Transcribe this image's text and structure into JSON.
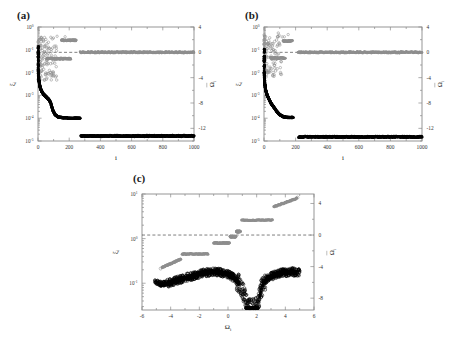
{
  "figure": {
    "panels": [
      {
        "label": "(a)",
        "xlabel": "i",
        "ylabel_left": "ξ",
        "ylabel_left_sub": "i",
        "ylabel_right": "Ω",
        "ylabel_right_sub": "i",
        "xticks": [
          "0",
          "200",
          "400",
          "600",
          "800",
          "1000"
        ],
        "xtick_values": [
          0,
          200,
          400,
          600,
          800,
          1000
        ],
        "xlim": [
          0,
          1000
        ],
        "yticks_left": [
          "10",
          "10",
          "10",
          "10",
          "10",
          "10"
        ],
        "yticks_left_exp": [
          "0",
          "-1",
          "-2",
          "-3",
          "-4",
          "-5"
        ],
        "ylim_left_log": [
          -5,
          0
        ],
        "yticks_right": [
          "4",
          "0",
          "-4",
          "-8",
          "-12"
        ],
        "ytick_right_values": [
          4,
          0,
          -4,
          -8,
          -12
        ],
        "ylim_right": [
          -14,
          4
        ]
      },
      {
        "label": "(b)",
        "xlabel": "i",
        "ylabel_left": "ξ",
        "ylabel_left_sub": "i",
        "ylabel_right": "Ω",
        "ylabel_right_sub": "i",
        "xticks": [
          "0",
          "200",
          "400",
          "600",
          "800",
          "1000"
        ],
        "xtick_values": [
          0,
          200,
          400,
          600,
          800,
          1000
        ],
        "xlim": [
          0,
          1000
        ],
        "yticks_left": [
          "10",
          "10",
          "10",
          "10",
          "10",
          "10"
        ],
        "yticks_left_exp": [
          "0",
          "-1",
          "-2",
          "-3",
          "-4",
          "-5"
        ],
        "ylim_left_log": [
          -5,
          0
        ],
        "yticks_right": [
          "4",
          "0",
          "-4",
          "-8",
          "-12"
        ],
        "ytick_right_values": [
          4,
          0,
          -4,
          -8,
          -12
        ],
        "ylim_right": [
          -14,
          4
        ]
      },
      {
        "label": "(c)",
        "xlabel": "Ω",
        "xlabel_sub": "i",
        "ylabel_left": "ξ",
        "ylabel_left_sub": "i",
        "ylabel_right": "Ω",
        "ylabel_right_sub": "i",
        "xticks": [
          "-6",
          "-4",
          "-2",
          "0",
          "2",
          "4",
          "6"
        ],
        "xtick_values": [
          -6,
          -4,
          -2,
          0,
          2,
          4,
          6
        ],
        "xlim": [
          -6,
          6
        ],
        "yticks_left": [
          "10",
          "10",
          "10"
        ],
        "yticks_left_exp": [
          "1",
          "0",
          "-1"
        ],
        "ylim_left_log": [
          -1.6,
          1.0
        ],
        "yticks_right": [
          "4",
          "0",
          "-4",
          "-8"
        ],
        "ytick_right_values": [
          4,
          0,
          -4,
          -8
        ],
        "ylim_right": [
          -9.5,
          5.2
        ]
      }
    ],
    "colors": {
      "gray_marker": "#8e8e8e",
      "black_marker": "#000000",
      "axis": "#8a8a8a",
      "dashed_zero": "#2a2a2a",
      "background": "#ffffff"
    }
  },
  "chart_data": {
    "type": "scatter",
    "title": "",
    "panel_count": 3,
    "panels": [
      {
        "label": "(a)",
        "xlabel": "i",
        "ylabel_left": "xi_i",
        "ylabel_right": "Omega_i bar",
        "xlim": [
          0,
          1000
        ],
        "ylim_left_log10": [
          -5,
          0
        ],
        "ylim_right": [
          -14,
          4
        ],
        "grid": false,
        "legend": "none",
        "annotations": [
          "dashed horizontal reference line at right-axis value 0"
        ],
        "series": [
          {
            "name": "Omega_i bar (gray open circles, right axis)",
            "marker": "open-circle",
            "color": "#8e8e8e",
            "axis": "right",
            "points_scatter_region": {
              "x_range": [
                0,
                120
              ],
              "y_range": [
                -4.4,
                2.6
              ],
              "n": 130
            },
            "bands": [
              {
                "x_range": [
                  150,
                  245
                ],
                "y": 1.9,
                "n": 60
              },
              {
                "x_range": [
                  55,
                  210
                ],
                "y": -1.0,
                "n": 90
              },
              {
                "x_range": [
                  270,
                  1000
                ],
                "y": 0.0,
                "n": 330
              }
            ]
          },
          {
            "name": "xi_i (black filled circles, left axis)",
            "marker": "filled-circle",
            "color": "#000000",
            "axis": "left",
            "decay_x": [
              2,
              6,
              12,
              22,
              35,
              50,
              65,
              80,
              95,
              110,
              130,
              160,
              200,
              240,
              270
            ],
            "decay_y_log10": [
              -2.0,
              -2.35,
              -2.6,
              -2.8,
              -2.95,
              -3.05,
              -3.15,
              -3.3,
              -3.65,
              -3.85,
              -3.95,
              -3.98,
              -4.0,
              -4.0,
              -4.0
            ],
            "plateau": {
              "x_range": [
                275,
                1000
              ],
              "y_log10": -4.78,
              "n": 320
            }
          }
        ]
      },
      {
        "label": "(b)",
        "xlabel": "i",
        "ylabel_left": "xi_i",
        "ylabel_right": "Omega_i bar",
        "xlim": [
          0,
          1000
        ],
        "ylim_left_log10": [
          -5,
          0
        ],
        "ylim_right": [
          -14,
          4
        ],
        "grid": false,
        "legend": "none",
        "annotations": [
          "dashed horizontal reference line at right-axis value 0"
        ],
        "series": [
          {
            "name": "Omega_i bar (gray open circles, right axis)",
            "marker": "open-circle",
            "color": "#8e8e8e",
            "axis": "right",
            "points_scatter_region": {
              "x_range": [
                0,
                110
              ],
              "y_range": [
                -4.0,
                2.8
              ],
              "n": 120
            },
            "bands": [
              {
                "x_range": [
                  120,
                  180
                ],
                "y": 1.8,
                "n": 40
              },
              {
                "x_range": [
                  40,
                  135
                ],
                "y": -0.9,
                "n": 60
              },
              {
                "x_range": [
                  215,
                  1000
                ],
                "y": 0.0,
                "n": 350
              }
            ]
          },
          {
            "name": "xi_i (black filled circles, left axis)",
            "marker": "filled-circle",
            "color": "#000000",
            "axis": "left",
            "decay_x": [
              2,
              5,
              10,
              18,
              30,
              45,
              60,
              80,
              100,
              120,
              140,
              160,
              185
            ],
            "decay_y_log10": [
              -2.1,
              -2.5,
              -2.75,
              -2.95,
              -3.15,
              -3.35,
              -3.5,
              -3.7,
              -3.85,
              -3.93,
              -3.96,
              -3.97,
              -3.97
            ],
            "plateau": {
              "x_range": [
                220,
                1000
              ],
              "y_log10": -4.82,
              "n": 330
            }
          }
        ]
      },
      {
        "label": "(c)",
        "xlabel": "Omega_i",
        "ylabel_left": "xi_i",
        "ylabel_right": "Omega_i bar",
        "xlim": [
          -6,
          6
        ],
        "ylim_left_log10": [
          -1.6,
          1.0
        ],
        "ylim_right": [
          -9.5,
          5.2
        ],
        "grid": false,
        "legend": "none",
        "annotations": [
          "dashed horizontal reference line at right-axis value 0"
        ],
        "series": [
          {
            "name": "Omega_i bar staircase (gray, right axis)",
            "marker": "filled-circle",
            "color": "#8e8e8e",
            "axis": "right",
            "steps": [
              {
                "x_range": [
                  -4.6,
                  -3.3
                ],
                "y": -4.1,
                "slope": true
              },
              {
                "x_range": [
                  -3.2,
                  -1.4
                ],
                "y": -2.4
              },
              {
                "x_range": [
                  -1.0,
                  0.1
                ],
                "y": -1.0
              },
              {
                "x_range": [
                  0.15,
                  0.55
                ],
                "y": -0.2
              },
              {
                "x_range": [
                  0.6,
                  0.85
                ],
                "y": 0.45
              },
              {
                "x_range": [
                  0.95,
                  3.1
                ],
                "y": 1.9
              },
              {
                "x_range": [
                  3.2,
                  4.8
                ],
                "y": 3.6,
                "slope": true
              }
            ]
          },
          {
            "name": "xi_i cloud (black open circles, left axis)",
            "marker": "open-circle",
            "color": "#000000",
            "axis": "left",
            "cloud_x": [
              -5.0,
              -4.6,
              -4.2,
              -3.8,
              -3.4,
              -3.0,
              -2.5,
              -2.0,
              -1.5,
              -1.0,
              -0.5,
              0.0,
              0.4,
              0.8,
              1.1,
              1.3,
              1.5,
              1.7,
              1.9,
              2.1,
              2.3,
              2.5,
              2.8,
              3.2,
              3.6,
              4.0,
              4.4,
              4.8
            ],
            "cloud_y_log10": [
              -0.98,
              -1.02,
              -1.0,
              -0.96,
              -0.92,
              -0.88,
              -0.84,
              -0.8,
              -0.76,
              -0.74,
              -0.76,
              -0.8,
              -0.88,
              -1.02,
              -1.22,
              -1.45,
              -1.55,
              -1.55,
              -1.55,
              -1.45,
              -1.15,
              -0.98,
              -0.88,
              -0.82,
              -0.78,
              -0.76,
              -0.74,
              -0.76
            ],
            "notes": "dense cloud, sharp minimum near Omega_i = 1.4 to 2.0, flat floor at log10(xi) approx -1.55"
          }
        ]
      }
    ]
  }
}
